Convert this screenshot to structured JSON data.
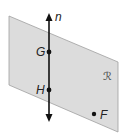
{
  "diagram": {
    "plane": {
      "label": "ℛ",
      "fill": "#dcdcdc",
      "stroke": "#9a9a9a"
    },
    "line": {
      "label": "n"
    },
    "points": [
      {
        "label": "G",
        "on": "line"
      },
      {
        "label": "H",
        "on": "line"
      },
      {
        "label": "F",
        "on": "plane"
      }
    ]
  }
}
